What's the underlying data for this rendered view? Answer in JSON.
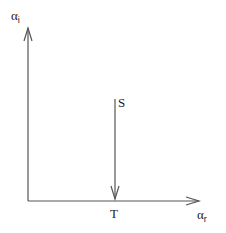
{
  "diagram": {
    "y_axis": {
      "symbol": "α",
      "subscript": "i"
    },
    "x_axis": {
      "symbol": "α",
      "subscript": "r"
    },
    "start_label": "S",
    "end_label": "T",
    "line_color": "#555555",
    "text_color": "#222222"
  }
}
